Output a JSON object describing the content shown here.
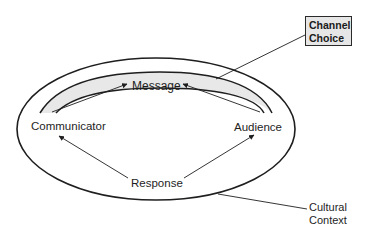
{
  "diagram": {
    "type": "communication-model",
    "nodes": {
      "message": "Message",
      "communicator": "Communicator",
      "audience": "Audience",
      "response": "Response"
    },
    "callouts": {
      "channel_choice": {
        "line1": "Channel",
        "line2": "Choice"
      },
      "cultural_context": {
        "line1": "Cultural",
        "line2": "Context"
      }
    },
    "edges": [
      {
        "from": "Communicator",
        "to": "Message"
      },
      {
        "from": "Audience",
        "to": "Message"
      },
      {
        "from": "Response",
        "to": "Communicator"
      },
      {
        "from": "Response",
        "to": "Audience"
      }
    ],
    "colors": {
      "stroke": "#1e1e1e",
      "band_fill": "#e8e8e8",
      "box_fill": "#e6e6e6",
      "background": "#ffffff"
    }
  }
}
